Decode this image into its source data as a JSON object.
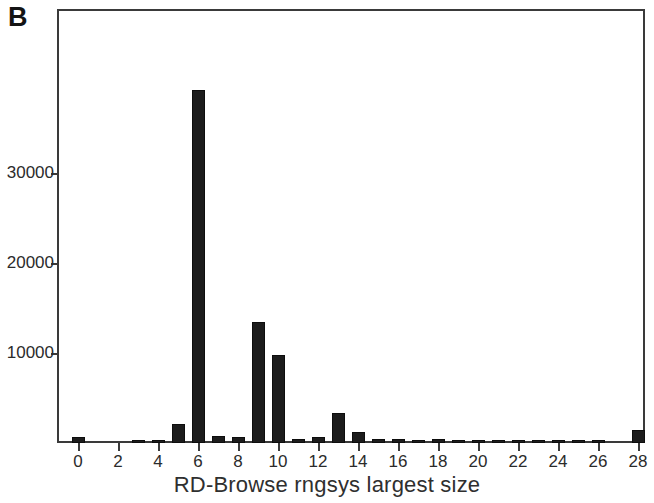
{
  "panel": {
    "label": "B"
  },
  "chart_data": {
    "type": "bar",
    "title": "",
    "xlabel": "RD-Browse rngsys largest size",
    "ylabel": "",
    "grid": false,
    "legend": false,
    "xlim": [
      -1,
      29
    ],
    "ylim": [
      0,
      40000
    ],
    "x_tick_labels": [
      "0",
      "2",
      "4",
      "6",
      "8",
      "10",
      "12",
      "14",
      "16",
      "18",
      "20",
      "22",
      "24",
      "26",
      "28"
    ],
    "x_tick_values": [
      0,
      2,
      4,
      6,
      8,
      10,
      12,
      14,
      16,
      18,
      20,
      22,
      24,
      26,
      28
    ],
    "y_tick_labels": [
      "10000",
      "20000",
      "30000"
    ],
    "y_tick_values": [
      10000,
      20000,
      30000
    ],
    "categories": [
      0,
      1,
      2,
      3,
      4,
      5,
      6,
      7,
      8,
      9,
      10,
      11,
      12,
      13,
      14,
      15,
      16,
      17,
      18,
      19,
      20,
      21,
      22,
      23,
      24,
      25,
      26,
      27,
      28
    ],
    "values": [
      700,
      0,
      0,
      250,
      300,
      2100,
      39200,
      800,
      700,
      13400,
      9800,
      500,
      700,
      3300,
      1200,
      500,
      400,
      350,
      400,
      300,
      300,
      250,
      250,
      250,
      250,
      250,
      250,
      0,
      1500
    ],
    "bar_color": "#1c1c1c",
    "axis_color": "#3a3a3a",
    "background": "#ffffff"
  }
}
